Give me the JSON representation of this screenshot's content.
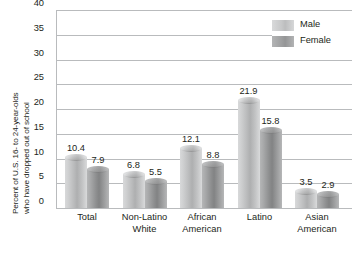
{
  "chart_data": {
    "type": "bar",
    "title": "",
    "xlabel": "",
    "ylabel_line1": "Percent of U.S. 16- to 24-year-olds",
    "ylabel_line2": "who have dropped out of school",
    "ylim": [
      0,
      40
    ],
    "ytick_step": 5,
    "yticks": [
      "0",
      "5",
      "10",
      "15",
      "20",
      "25",
      "30",
      "35",
      "40"
    ],
    "grid": true,
    "legend_position": "top-right",
    "categories": [
      {
        "line1": "Total",
        "line2": ""
      },
      {
        "line1": "Non-Latino",
        "line2": "White"
      },
      {
        "line1": "African",
        "line2": "American"
      },
      {
        "line1": "Latino",
        "line2": ""
      },
      {
        "line1": "Asian",
        "line2": "American"
      }
    ],
    "series": [
      {
        "name": "Male",
        "color": "#c6c7c8",
        "values": [
          10.4,
          6.8,
          12.1,
          21.9,
          3.5
        ]
      },
      {
        "name": "Female",
        "color": "#9d9e9f",
        "values": [
          7.9,
          5.5,
          8.8,
          15.8,
          2.9
        ]
      }
    ],
    "value_labels": {
      "male": [
        "10.4",
        "6.8",
        "12.1",
        "21.9",
        "3.5"
      ],
      "female": [
        "7.9",
        "5.5",
        "8.8",
        "15.8",
        "2.9"
      ]
    }
  },
  "legend": {
    "items": [
      {
        "label": "Male"
      },
      {
        "label": "Female"
      }
    ]
  }
}
